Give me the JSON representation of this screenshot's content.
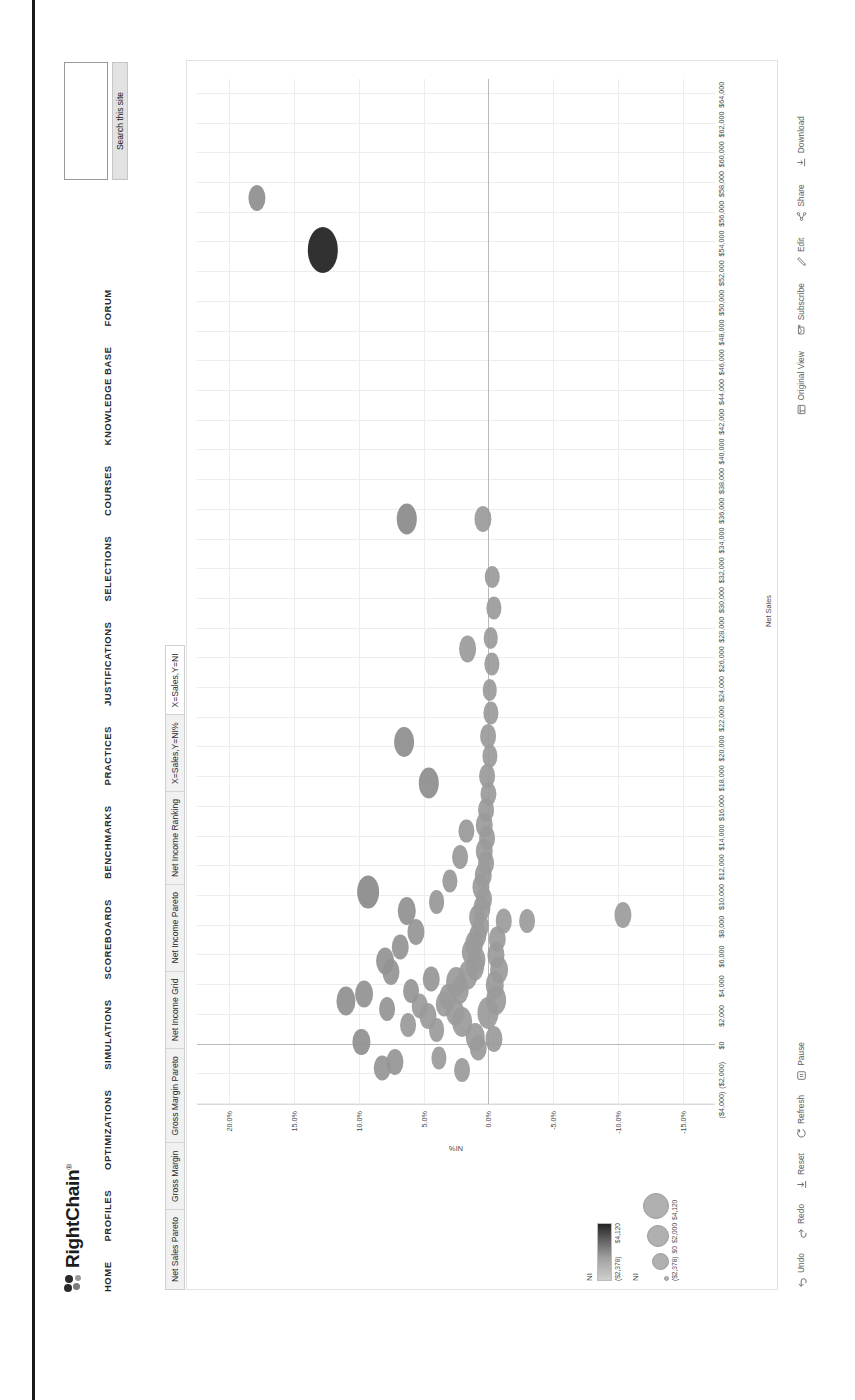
{
  "site": {
    "logo_text": "RightChain",
    "logo_trademark": "®",
    "nav": [
      {
        "label": "HOME"
      },
      {
        "label": "PROFILES"
      },
      {
        "label": "OPTIMIZATIONS"
      },
      {
        "label": "SIMULATIONS"
      },
      {
        "label": "SCOREBOARDS"
      },
      {
        "label": "BENCHMARKS"
      },
      {
        "label": "PRACTICES"
      },
      {
        "label": "JUSTIFICATIONS"
      },
      {
        "label": "SELECTIONS"
      },
      {
        "label": "COURSES"
      },
      {
        "label": "KNOWLEDGE BASE"
      },
      {
        "label": "FORUM"
      }
    ],
    "search": {
      "value": "",
      "placeholder": "",
      "button_label": "Search this site"
    }
  },
  "viz": {
    "tabs": [
      {
        "label": "Net Sales Pareto",
        "active": false
      },
      {
        "label": "Gross Margin",
        "active": false
      },
      {
        "label": "Gross Margin Pareto",
        "active": false
      },
      {
        "label": "Net Income Grid",
        "active": false
      },
      {
        "label": "Net Income Pareto",
        "active": false
      },
      {
        "label": "Net Income Ranking",
        "active": false
      },
      {
        "label": "X=Sales,Y=NI%",
        "active": false
      },
      {
        "label": "X=Sales,Y=NI",
        "active": true
      }
    ],
    "toolbar_left": [
      {
        "label": "Undo",
        "icon": "undo-icon"
      },
      {
        "label": "Redo",
        "icon": "redo-icon"
      },
      {
        "label": "Reset",
        "icon": "reset-icon"
      },
      {
        "label": "Refresh",
        "icon": "refresh-icon"
      },
      {
        "label": "Pause",
        "icon": "pause-icon"
      }
    ],
    "toolbar_right": [
      {
        "label": "Original View",
        "icon": "original-view-icon"
      },
      {
        "label": "Subscribe",
        "icon": "subscribe-icon"
      },
      {
        "label": "Edit",
        "icon": "edit-icon"
      },
      {
        "label": "Share",
        "icon": "share-icon"
      },
      {
        "label": "Download",
        "icon": "download-icon"
      }
    ]
  },
  "legend": {
    "color": {
      "title": "NI",
      "min_label": "($2,378)",
      "max_label": "$4,120",
      "min_color": "#d6d6d6",
      "max_color": "#1e1e1e"
    },
    "size": {
      "title": "NI",
      "labels": [
        "($2,378)",
        "$0",
        "$2,000",
        "$4,120"
      ],
      "dot_sizes": [
        3,
        15,
        20,
        24
      ]
    }
  },
  "chart_data": {
    "type": "scatter",
    "title": "X=Sales,Y=NI%",
    "xlabel": "Net Sales",
    "ylabel": "NI%",
    "grid": true,
    "legend_position": "left",
    "xlim": [
      -4000,
      65000
    ],
    "ylim": [
      -17.5,
      22.5
    ],
    "xticks": [
      -4000,
      -2000,
      0,
      2000,
      4000,
      6000,
      8000,
      10000,
      12000,
      14000,
      16000,
      18000,
      20000,
      22000,
      24000,
      26000,
      28000,
      30000,
      32000,
      34000,
      36000,
      38000,
      40000,
      42000,
      44000,
      46000,
      48000,
      50000,
      52000,
      54000,
      56000,
      58000,
      60000,
      62000,
      64000
    ],
    "xticklabels": [
      "($4,000)",
      "($2,000)",
      "$0",
      "$2,000",
      "$4,000",
      "$6,000",
      "$8,000",
      "$10,000",
      "$12,000",
      "$14,000",
      "$16,000",
      "$18,000",
      "$20,000",
      "$22,000",
      "$24,000",
      "$26,000",
      "$28,000",
      "$30,000",
      "$32,000",
      "$34,000",
      "$36,000",
      "$38,000",
      "$40,000",
      "$42,000",
      "$44,000",
      "$46,000",
      "$48,000",
      "$50,000",
      "$52,000",
      "$54,000",
      "$56,000",
      "$58,000",
      "$60,000",
      "$62,000",
      "$64,000"
    ],
    "yticks": [
      20,
      15,
      10,
      5,
      0,
      -5,
      -10,
      -15
    ],
    "yticklabels": [
      "20.0%",
      "15.0%",
      "10.0%",
      "5.0%",
      "0.0%",
      "-5.0%",
      "-10.0%",
      "-15.0%"
    ],
    "size_field": "NI",
    "color_field": "NI",
    "points": [
      {
        "x": 53500,
        "y": 12.8,
        "size": 46,
        "color": "#1f1f1f"
      },
      {
        "x": 57000,
        "y": 17.9,
        "size": 26,
        "color": "#8e8e8e"
      },
      {
        "x": 35400,
        "y": 6.3,
        "size": 31,
        "color": "#8a8a8a"
      },
      {
        "x": 35400,
        "y": 0.4,
        "size": 26,
        "color": "#9a9a9a"
      },
      {
        "x": 26600,
        "y": 1.6,
        "size": 27,
        "color": "#9a9a9a"
      },
      {
        "x": 20400,
        "y": 6.5,
        "size": 30,
        "color": "#8d8d8d"
      },
      {
        "x": 17600,
        "y": 4.6,
        "size": 31,
        "color": "#8d8d8d"
      },
      {
        "x": 10300,
        "y": 9.3,
        "size": 33,
        "color": "#8a8a8a"
      },
      {
        "x": 9000,
        "y": 6.3,
        "size": 28,
        "color": "#909090"
      },
      {
        "x": 8300,
        "y": -1.2,
        "size": 25,
        "color": "#9b9b9b"
      },
      {
        "x": 8300,
        "y": -3.0,
        "size": 24,
        "color": "#9b9b9b"
      },
      {
        "x": 8700,
        "y": -10.4,
        "size": 26,
        "color": "#9b9b9b"
      },
      {
        "x": 2900,
        "y": 11.0,
        "size": 29,
        "color": "#8f8f8f"
      },
      {
        "x": 3400,
        "y": 9.6,
        "size": 27,
        "color": "#919191"
      },
      {
        "x": 4900,
        "y": 7.5,
        "size": 26,
        "color": "#949494"
      },
      {
        "x": 500,
        "y": 1.0,
        "size": 28,
        "color": "#9a9a9a"
      },
      {
        "x": 1500,
        "y": 2.0,
        "size": 30,
        "color": "#9a9a9a"
      },
      {
        "x": 2200,
        "y": 2.6,
        "size": 27,
        "color": "#9a9a9a"
      },
      {
        "x": 2700,
        "y": 3.4,
        "size": 25,
        "color": "#9a9a9a"
      },
      {
        "x": 3200,
        "y": 3.1,
        "size": 26,
        "color": "#9a9a9a"
      },
      {
        "x": 3700,
        "y": 2.2,
        "size": 28,
        "color": "#9a9a9a"
      },
      {
        "x": 4200,
        "y": 2.5,
        "size": 30,
        "color": "#9a9a9a"
      },
      {
        "x": 4700,
        "y": 1.6,
        "size": 29,
        "color": "#9a9a9a"
      },
      {
        "x": 5200,
        "y": 1.0,
        "size": 27,
        "color": "#9a9a9a"
      },
      {
        "x": 5700,
        "y": 0.9,
        "size": 26,
        "color": "#9a9a9a"
      },
      {
        "x": 6200,
        "y": 1.4,
        "size": 25,
        "color": "#9a9a9a"
      },
      {
        "x": 6800,
        "y": 1.1,
        "size": 27,
        "color": "#9a9a9a"
      },
      {
        "x": 7400,
        "y": 0.8,
        "size": 26,
        "color": "#9a9a9a"
      },
      {
        "x": 8000,
        "y": 0.6,
        "size": 25,
        "color": "#9a9a9a"
      },
      {
        "x": 8600,
        "y": 0.9,
        "size": 24,
        "color": "#9a9a9a"
      },
      {
        "x": 9200,
        "y": 0.5,
        "size": 26,
        "color": "#9a9a9a"
      },
      {
        "x": 9800,
        "y": 0.3,
        "size": 24,
        "color": "#9a9a9a"
      },
      {
        "x": 10600,
        "y": 0.6,
        "size": 26,
        "color": "#9a9a9a"
      },
      {
        "x": 11400,
        "y": 0.4,
        "size": 25,
        "color": "#9a9a9a"
      },
      {
        "x": 12200,
        "y": 0.2,
        "size": 24,
        "color": "#9a9a9a"
      },
      {
        "x": 13000,
        "y": 0.3,
        "size": 25,
        "color": "#9a9a9a"
      },
      {
        "x": 13900,
        "y": 0.1,
        "size": 24,
        "color": "#9a9a9a"
      },
      {
        "x": 14800,
        "y": 0.3,
        "size": 25,
        "color": "#9a9a9a"
      },
      {
        "x": 15800,
        "y": 0.2,
        "size": 24,
        "color": "#9a9a9a"
      },
      {
        "x": 16900,
        "y": 0.0,
        "size": 23,
        "color": "#9a9a9a"
      },
      {
        "x": 18100,
        "y": 0.1,
        "size": 24,
        "color": "#9a9a9a"
      },
      {
        "x": 19400,
        "y": -0.1,
        "size": 23,
        "color": "#9a9a9a"
      },
      {
        "x": 20800,
        "y": 0.0,
        "size": 24,
        "color": "#9a9a9a"
      },
      {
        "x": 22300,
        "y": -0.2,
        "size": 23,
        "color": "#9a9a9a"
      },
      {
        "x": 23900,
        "y": -0.1,
        "size": 22,
        "color": "#9a9a9a"
      },
      {
        "x": 25600,
        "y": -0.3,
        "size": 23,
        "color": "#9a9a9a"
      },
      {
        "x": 27400,
        "y": -0.2,
        "size": 22,
        "color": "#9a9a9a"
      },
      {
        "x": 29400,
        "y": -0.4,
        "size": 23,
        "color": "#9a9a9a"
      },
      {
        "x": 31500,
        "y": -0.3,
        "size": 22,
        "color": "#9a9a9a"
      },
      {
        "x": 1000,
        "y": 4.0,
        "size": 24,
        "color": "#9a9a9a"
      },
      {
        "x": 1900,
        "y": 4.7,
        "size": 26,
        "color": "#9a9a9a"
      },
      {
        "x": 2600,
        "y": 5.3,
        "size": 25,
        "color": "#9a9a9a"
      },
      {
        "x": 1300,
        "y": 6.2,
        "size": 24,
        "color": "#999999"
      },
      {
        "x": 2100,
        "y": 0.0,
        "size": 32,
        "color": "#9a9a9a"
      },
      {
        "x": 3000,
        "y": -0.6,
        "size": 30,
        "color": "#9a9a9a"
      },
      {
        "x": 4000,
        "y": -0.5,
        "size": 28,
        "color": "#9a9a9a"
      },
      {
        "x": 5000,
        "y": -0.8,
        "size": 27,
        "color": "#9a9a9a"
      },
      {
        "x": 6000,
        "y": -0.6,
        "size": 26,
        "color": "#9a9a9a"
      },
      {
        "x": 7100,
        "y": -0.7,
        "size": 25,
        "color": "#9a9a9a"
      },
      {
        "x": 400,
        "y": -0.4,
        "size": 26,
        "color": "#9a9a9a"
      },
      {
        "x": -200,
        "y": 0.8,
        "size": 25,
        "color": "#9a9a9a"
      },
      {
        "x": -1700,
        "y": 2.0,
        "size": 24,
        "color": "#9a9a9a"
      },
      {
        "x": -900,
        "y": 3.8,
        "size": 23,
        "color": "#9a9a9a"
      },
      {
        "x": -1200,
        "y": 7.2,
        "size": 26,
        "color": "#959595"
      },
      {
        "x": -1600,
        "y": 8.2,
        "size": 25,
        "color": "#959595"
      },
      {
        "x": 200,
        "y": 9.8,
        "size": 26,
        "color": "#8f8f8f"
      },
      {
        "x": 5600,
        "y": 8.0,
        "size": 27,
        "color": "#939393"
      },
      {
        "x": 6600,
        "y": 6.8,
        "size": 25,
        "color": "#949494"
      },
      {
        "x": 7600,
        "y": 5.6,
        "size": 26,
        "color": "#959595"
      },
      {
        "x": 9600,
        "y": 4.0,
        "size": 24,
        "color": "#979797"
      },
      {
        "x": 11000,
        "y": 3.0,
        "size": 23,
        "color": "#989898"
      },
      {
        "x": 12600,
        "y": 2.2,
        "size": 24,
        "color": "#989898"
      },
      {
        "x": 14400,
        "y": 1.7,
        "size": 23,
        "color": "#989898"
      },
      {
        "x": 4400,
        "y": 4.4,
        "size": 25,
        "color": "#969696"
      },
      {
        "x": 3600,
        "y": 6.0,
        "size": 24,
        "color": "#959595"
      },
      {
        "x": 2400,
        "y": 7.8,
        "size": 24,
        "color": "#949494"
      }
    ]
  }
}
